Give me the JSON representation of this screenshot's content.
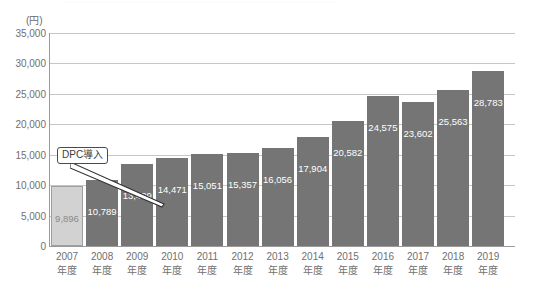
{
  "chart_data": {
    "type": "bar",
    "title": "",
    "xlabel": "",
    "ylabel": "(円)",
    "ylim": [
      0,
      35000
    ],
    "ytick_step": 5000,
    "yticks": [
      "35,000",
      "30,000",
      "25,000",
      "20,000",
      "15,000",
      "10,000",
      "5,000",
      "0"
    ],
    "ytick_values": [
      35000,
      30000,
      25000,
      20000,
      15000,
      10000,
      5000,
      0
    ],
    "grid": true,
    "legend": "none",
    "categories": [
      "2007年度",
      "2008年度",
      "2009年度",
      "2010年度",
      "2011年度",
      "2012年度",
      "2013年度",
      "2014年度",
      "2015年度",
      "2016年度",
      "2017年度",
      "2018年度",
      "2019年度"
    ],
    "category_year": [
      "2007",
      "2008",
      "2009",
      "2010",
      "2011",
      "2012",
      "2013",
      "2014",
      "2015",
      "2016",
      "2017",
      "2018",
      "2019"
    ],
    "category_suffix": "年度",
    "values": [
      9896,
      10789,
      13429,
      14471,
      15051,
      15357,
      16056,
      17904,
      20582,
      24575,
      23602,
      25563,
      28783
    ],
    "value_labels": [
      "9,896",
      "10,789",
      "13,429",
      "14,471",
      "15,051",
      "15,357",
      "16,056",
      "17,904",
      "20,582",
      "24,575",
      "23,602",
      "25,563",
      "28,783"
    ],
    "bar_colors": [
      "#d2d2d2",
      "#757575",
      "#757575",
      "#757575",
      "#757575",
      "#757575",
      "#757575",
      "#757575",
      "#757575",
      "#757575",
      "#757575",
      "#757575",
      "#757575"
    ],
    "highlight_index": 0,
    "annotations": [
      {
        "text": "DPC導入",
        "points_to_category": "2008年度"
      }
    ]
  },
  "colors": {
    "bar_default": "#757575",
    "bar_highlight": "#d2d2d2",
    "grid": "#c6c6c6",
    "axis": "#9a9a9a",
    "tick_text": "#6f6f6f",
    "value_text_on_dark": "#ffffff",
    "value_text_on_light": "#8a8a8a",
    "callout_border": "#4a4a4a",
    "background": "#ffffff"
  }
}
